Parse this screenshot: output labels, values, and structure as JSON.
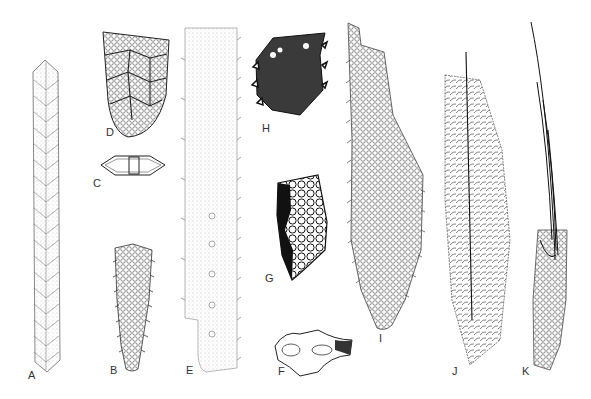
{
  "figure": {
    "type": "scientific illustration plate",
    "panels": [
      {
        "label": "A",
        "description": "long slender serrated spicule with chevron pattern",
        "label_pos": [
          28,
          378
        ]
      },
      {
        "label": "B",
        "description": "tapering granular spicule with toothed margins",
        "label_pos": [
          110,
          373
        ]
      },
      {
        "label": "C",
        "description": "dumbbell / biconvex cross-section",
        "label_pos": [
          93,
          186
        ]
      },
      {
        "label": "D",
        "description": "net-like cup-shaped reticulate structure",
        "label_pos": [
          106,
          135
        ]
      },
      {
        "label": "E",
        "description": "broad stippled plate with serrated edges and holes",
        "label_pos": [
          188,
          373
        ]
      },
      {
        "label": "F",
        "description": "irregular cross-section fragment",
        "label_pos": [
          280,
          374
        ]
      },
      {
        "label": "G",
        "description": "dark-edged reticulate fragment with large cells",
        "label_pos": [
          266,
          281
        ]
      },
      {
        "label": "H",
        "description": "dark spiny fragment",
        "label_pos": [
          263,
          130
        ]
      },
      {
        "label": "I",
        "description": "long reticulate spindle with serrated edge",
        "label_pos": [
          380,
          341
        ]
      },
      {
        "label": "J",
        "description": "hairy spindle with central axis",
        "label_pos": [
          453,
          373
        ]
      },
      {
        "label": "K",
        "description": "bristly spicule with long terminal fibres",
        "label_pos": [
          524,
          373
        ]
      }
    ]
  },
  "colors": {
    "ink": "#1a1a1a",
    "stipple": "#777777",
    "background": "#ffffff"
  }
}
